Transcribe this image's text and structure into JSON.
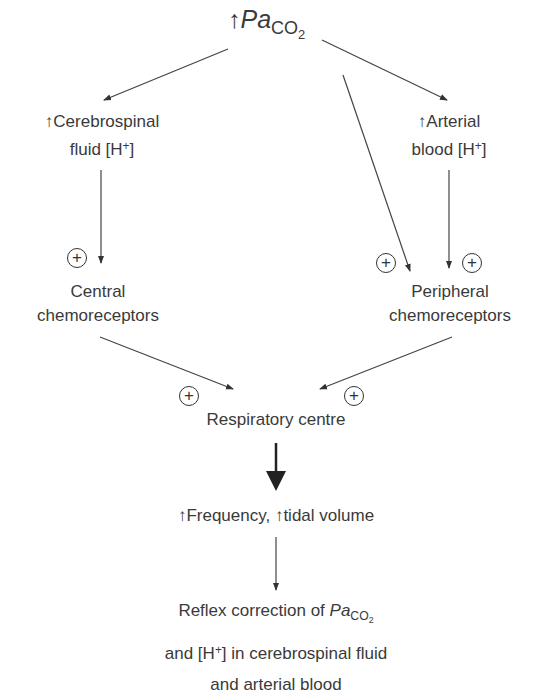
{
  "top": {
    "arrow": "↑",
    "pa": "Pa",
    "co": "CO",
    "two": "2"
  },
  "csf": {
    "line1": "↑Cerebrospinal",
    "line2_prefix": "fluid [H",
    "sup": "+",
    "line2_suffix": "]"
  },
  "arterial": {
    "line1": "↑Arterial",
    "line2_prefix": "blood [H",
    "sup": "+",
    "line2_suffix": "]"
  },
  "central": {
    "line1": "Central",
    "line2": "chemoreceptors"
  },
  "peripheral": {
    "line1": "Peripheral",
    "line2": "chemoreceptors"
  },
  "respiratory": {
    "label": "Respiratory centre"
  },
  "frequency": {
    "label": "↑Frequency, ↑tidal volume"
  },
  "reflex": {
    "line1_prefix": "Reflex correction of ",
    "pa": "Pa",
    "co": "CO",
    "two": "2",
    "line2_prefix": "and [H",
    "sup": "+",
    "line2_suffix": "] in cerebrospinal fluid",
    "line3": "and arterial blood"
  },
  "stimulatory_symbol": "+"
}
